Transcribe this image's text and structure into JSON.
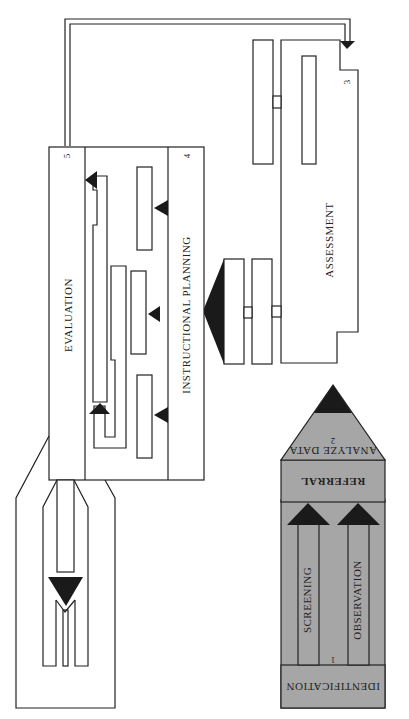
{
  "diagram": {
    "orientation": "rotated 90deg (reads sideways)",
    "stages": [
      {
        "number": "1",
        "label": "IDENTIFICATION",
        "sub_paths": [
          "SCREENING",
          "OBSERVATION"
        ]
      },
      {
        "number": "2",
        "label": "REFERRAL",
        "sub_label": "ANALYZE DATA"
      },
      {
        "number": "3",
        "label": "ASSESSMENT"
      },
      {
        "number": "4",
        "label": "INSTRUCTIONAL PLANNING"
      },
      {
        "number": "5",
        "label": "EVALUATION"
      }
    ],
    "colors": {
      "stage12_fill": "#a6a6a6",
      "line": "#222222",
      "arrow": "#1a1a1a",
      "background": "#ffffff"
    }
  }
}
